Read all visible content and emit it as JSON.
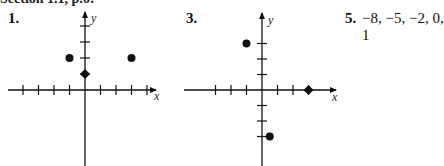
{
  "header": {
    "text": "Section 1.1, p.6:"
  },
  "problems": [
    {
      "number": "1.",
      "axes": {
        "x_label": "x",
        "y_label": "y"
      },
      "points": [
        {
          "x": -1,
          "y": 2,
          "shape": "dot"
        },
        {
          "x": 3,
          "y": 2,
          "shape": "dot"
        },
        {
          "x": 0,
          "y": 1,
          "shape": "diamond"
        }
      ],
      "x_ticks": [
        -4,
        -3,
        -2,
        -1,
        1,
        2,
        3,
        4
      ],
      "y_ticks": [
        1,
        2,
        3,
        4
      ]
    },
    {
      "number": "3.",
      "axes": {
        "x_label": "x",
        "y_label": "y"
      },
      "points": [
        {
          "x": -1,
          "y": 3,
          "shape": "dot"
        },
        {
          "x": 3,
          "y": 0,
          "shape": "diamond"
        },
        {
          "x": 0.5,
          "y": -3,
          "shape": "dot"
        }
      ],
      "x_ticks": [
        -3,
        -2,
        -1,
        1,
        2,
        3
      ],
      "y_ticks": [
        -3,
        -2,
        -1,
        1,
        2,
        3
      ]
    },
    {
      "number": "5.",
      "answer": "−8, −5, −2, 0, 1"
    }
  ]
}
